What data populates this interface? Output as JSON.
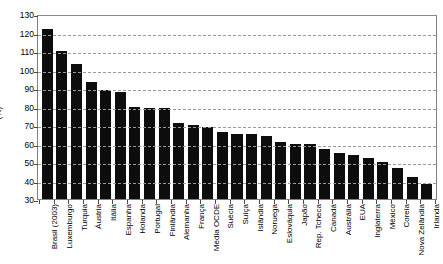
{
  "chart_data": {
    "type": "bar",
    "title": "",
    "subtitle": "",
    "xlabel": "",
    "ylabel": "(%)",
    "ylim": [
      30,
      130
    ],
    "ytick_step": 10,
    "yticks": [
      130,
      120,
      110,
      100,
      90,
      80,
      70,
      60,
      50,
      40,
      30
    ],
    "gridlines": [
      120,
      110,
      100,
      90,
      80,
      70,
      60,
      50,
      40
    ],
    "grid": true,
    "legend": null,
    "legend_position": "none",
    "bar_color": "#0d0d0d",
    "categories": [
      "Brasil (2003)",
      "Luxemburgo",
      "Turquia",
      "Áustria",
      "Itália",
      "Espanha",
      "Holanda",
      "Portugal",
      "Finlândia",
      "Alemanha",
      "França",
      "Média OCDE",
      "Suécia",
      "Suíça",
      "Islândia",
      "Noruega",
      "Eslováquia",
      "Japão",
      "Rep. Tcheca",
      "Canadá",
      "Austrália",
      "EUA",
      "Inglaterra",
      "México",
      "Coreia",
      "Nova Zelândia",
      "Irlanda"
    ],
    "values": [
      122,
      110,
      103,
      93,
      89,
      88,
      80,
      79,
      79,
      71,
      70,
      69,
      66,
      65,
      65,
      64,
      61,
      60,
      60,
      57,
      55,
      54,
      52,
      50,
      47,
      42,
      38
    ]
  }
}
